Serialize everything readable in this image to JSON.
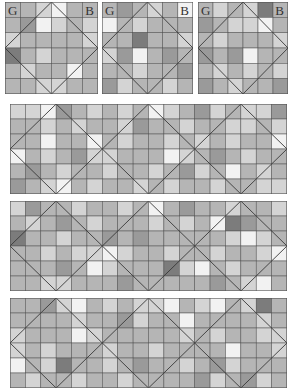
{
  "palette": [
    "#f2f2f2",
    "#d4d4d4",
    "#b5b5b5",
    "#9a9a9a",
    "#7c7c7c"
  ],
  "small_panels": [
    {
      "id": "small-1",
      "x": 5,
      "y": 2,
      "w": 93,
      "h": 92,
      "label_left": "G",
      "label_right": "B",
      "grid": [
        [
          2,
          2,
          1,
          0,
          2,
          2
        ],
        [
          2,
          3,
          0,
          1,
          2,
          1
        ],
        [
          1,
          2,
          2,
          2,
          2,
          1
        ],
        [
          4,
          2,
          1,
          2,
          2,
          2
        ],
        [
          2,
          1,
          2,
          2,
          0,
          2
        ],
        [
          2,
          2,
          1,
          1,
          2,
          2
        ]
      ]
    },
    {
      "id": "small-2",
      "x": 102,
      "y": 2,
      "w": 91,
      "h": 92,
      "label_left": "G",
      "label_right": "B",
      "grid": [
        [
          2,
          3,
          2,
          1,
          2,
          0
        ],
        [
          0,
          2,
          1,
          2,
          2,
          2
        ],
        [
          2,
          2,
          4,
          2,
          2,
          1
        ],
        [
          1,
          3,
          0,
          2,
          3,
          2
        ],
        [
          2,
          2,
          1,
          2,
          2,
          3
        ],
        [
          3,
          1,
          2,
          2,
          1,
          2
        ]
      ]
    },
    {
      "id": "small-3",
      "x": 198,
      "y": 2,
      "w": 90,
      "h": 92,
      "label_left": "G",
      "label_right": "B",
      "grid": [
        [
          2,
          1,
          2,
          1,
          4,
          2
        ],
        [
          3,
          2,
          1,
          1,
          0,
          2
        ],
        [
          2,
          1,
          2,
          2,
          2,
          1
        ],
        [
          3,
          2,
          3,
          0,
          2,
          2
        ],
        [
          2,
          1,
          2,
          1,
          2,
          1
        ],
        [
          3,
          2,
          1,
          2,
          2,
          3
        ]
      ]
    }
  ],
  "wide_panels": [
    {
      "id": "wide-1",
      "x": 10,
      "y": 104,
      "w": 277,
      "h": 90,
      "grid": [
        [
          1,
          1,
          0,
          3,
          2,
          1,
          2,
          1,
          2,
          0,
          1,
          2,
          3,
          1,
          2,
          1,
          1,
          3
        ],
        [
          2,
          2,
          1,
          2,
          1,
          2,
          2,
          1,
          3,
          2,
          2,
          1,
          2,
          2,
          1,
          1,
          2,
          1
        ],
        [
          2,
          2,
          0,
          2,
          2,
          0,
          2,
          1,
          2,
          2,
          1,
          2,
          1,
          2,
          1,
          2,
          2,
          0
        ],
        [
          0,
          2,
          1,
          2,
          3,
          1,
          1,
          2,
          2,
          2,
          0,
          1,
          2,
          3,
          2,
          1,
          2,
          2
        ],
        [
          2,
          3,
          2,
          1,
          2,
          2,
          1,
          2,
          2,
          1,
          2,
          3,
          1,
          2,
          0,
          2,
          1,
          2
        ],
        [
          3,
          2,
          1,
          0,
          2,
          1,
          2,
          2,
          1,
          2,
          1,
          2,
          2,
          1,
          2,
          2,
          1,
          1
        ]
      ]
    },
    {
      "id": "wide-2",
      "x": 10,
      "y": 201,
      "w": 277,
      "h": 90,
      "grid": [
        [
          1,
          3,
          2,
          2,
          1,
          2,
          2,
          1,
          2,
          0,
          2,
          3,
          2,
          2,
          1,
          2,
          2,
          1
        ],
        [
          2,
          1,
          2,
          3,
          2,
          1,
          2,
          2,
          2,
          1,
          2,
          1,
          2,
          0,
          4,
          3,
          2,
          2
        ],
        [
          4,
          2,
          2,
          1,
          2,
          2,
          3,
          2,
          3,
          2,
          2,
          2,
          2,
          2,
          1,
          0,
          1,
          2
        ],
        [
          2,
          2,
          1,
          2,
          1,
          1,
          0,
          1,
          2,
          2,
          1,
          2,
          2,
          1,
          2,
          2,
          1,
          0
        ],
        [
          2,
          2,
          2,
          3,
          2,
          0,
          1,
          2,
          2,
          2,
          4,
          1,
          0,
          2,
          1,
          2,
          2,
          2
        ],
        [
          2,
          2,
          1,
          1,
          2,
          2,
          2,
          3,
          2,
          2,
          2,
          2,
          2,
          3,
          2,
          1,
          0,
          2
        ]
      ]
    },
    {
      "id": "wide-3",
      "x": 10,
      "y": 298,
      "w": 277,
      "h": 90,
      "grid": [
        [
          2,
          2,
          3,
          1,
          0,
          2,
          1,
          2,
          1,
          1,
          0,
          2,
          1,
          0,
          2,
          1,
          4,
          2
        ],
        [
          2,
          2,
          2,
          2,
          1,
          2,
          2,
          3,
          1,
          2,
          2,
          0,
          2,
          2,
          2,
          2,
          1,
          2
        ],
        [
          1,
          2,
          2,
          2,
          0,
          1,
          2,
          2,
          2,
          2,
          2,
          1,
          2,
          1,
          2,
          2,
          1,
          1
        ],
        [
          1,
          2,
          1,
          2,
          2,
          2,
          1,
          2,
          2,
          1,
          2,
          2,
          2,
          2,
          0,
          2,
          2,
          1
        ],
        [
          0,
          2,
          1,
          4,
          2,
          2,
          1,
          2,
          3,
          2,
          2,
          1,
          2,
          3,
          1,
          2,
          2,
          2
        ],
        [
          2,
          1,
          2,
          2,
          1,
          2,
          2,
          1,
          2,
          2,
          2,
          2,
          3,
          1,
          2,
          3,
          1,
          2
        ]
      ]
    }
  ],
  "line_color": "#3a3a3a",
  "grid_line_color": "#555555"
}
